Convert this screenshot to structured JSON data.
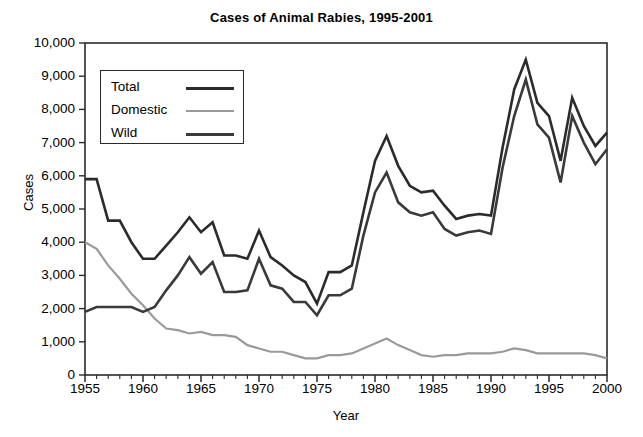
{
  "chart_data": {
    "type": "line",
    "title": "Cases of Animal Rabies, 1995-2001",
    "xlabel": "Year",
    "ylabel": "Cases",
    "xlim": [
      1955,
      2000
    ],
    "ylim": [
      0,
      10000
    ],
    "grid": false,
    "legend_position": "upper-left-inside",
    "ytick_labels": [
      "10,000",
      "9,000",
      "8,000",
      "7,000",
      "6,000",
      "5,000",
      "4,000",
      "3,000",
      "2,000",
      "1,000",
      "0"
    ],
    "ytick_values": [
      10000,
      9000,
      8000,
      7000,
      6000,
      5000,
      4000,
      3000,
      2000,
      1000,
      0
    ],
    "xtick_labels": [
      "1955",
      "1960",
      "1965",
      "1970",
      "1975",
      "1980",
      "1985",
      "1990",
      "1995",
      "2000"
    ],
    "xtick_values": [
      1955,
      1960,
      1965,
      1970,
      1975,
      1980,
      1985,
      1990,
      1995,
      2000
    ],
    "x": [
      1955,
      1956,
      1957,
      1958,
      1959,
      1960,
      1961,
      1962,
      1963,
      1964,
      1965,
      1966,
      1967,
      1968,
      1969,
      1970,
      1971,
      1972,
      1973,
      1974,
      1975,
      1976,
      1977,
      1978,
      1979,
      1980,
      1981,
      1982,
      1983,
      1984,
      1985,
      1986,
      1987,
      1988,
      1989,
      1990,
      1991,
      1992,
      1993,
      1994,
      1995,
      1996,
      1997,
      1998,
      1999,
      2000
    ],
    "series": [
      {
        "name": "Total",
        "color": "#2b2b2b",
        "values": [
          5900,
          5900,
          4650,
          4650,
          4000,
          3500,
          3500,
          3900,
          4300,
          4750,
          4300,
          4600,
          3600,
          3600,
          3500,
          4350,
          3550,
          3300,
          3000,
          2800,
          2150,
          3100,
          3100,
          3300,
          4900,
          6450,
          7200,
          6300,
          5700,
          5500,
          5550,
          5100,
          4700,
          4800,
          4850,
          4800,
          6850,
          8600,
          9500,
          8200,
          7800,
          6450,
          8350,
          7500,
          6900,
          7300
        ]
      },
      {
        "name": "Domestic",
        "color": "#9a9a9a",
        "values": [
          4000,
          3800,
          3300,
          2900,
          2450,
          2100,
          1700,
          1400,
          1350,
          1250,
          1300,
          1200,
          1200,
          1150,
          900,
          800,
          700,
          700,
          600,
          500,
          500,
          600,
          600,
          650,
          800,
          950,
          1100,
          900,
          750,
          600,
          550,
          600,
          600,
          650,
          650,
          650,
          700,
          800,
          750,
          650,
          650,
          650,
          650,
          650,
          600,
          500
        ]
      },
      {
        "name": "Wild",
        "color": "#3a3a3a",
        "values": [
          1900,
          2050,
          2050,
          2050,
          2050,
          1900,
          2050,
          2550,
          3000,
          3550,
          3050,
          3400,
          2500,
          2500,
          2550,
          3500,
          2700,
          2600,
          2200,
          2200,
          1800,
          2400,
          2400,
          2600,
          4200,
          5500,
          6100,
          5200,
          4900,
          4800,
          4900,
          4400,
          4200,
          4300,
          4350,
          4250,
          6250,
          7800,
          8900,
          7550,
          7150,
          5800,
          7800,
          7000,
          6350,
          6800
        ]
      }
    ]
  },
  "legend": {
    "items": [
      {
        "label": "Total"
      },
      {
        "label": "Domestic"
      },
      {
        "label": "Wild"
      }
    ]
  }
}
